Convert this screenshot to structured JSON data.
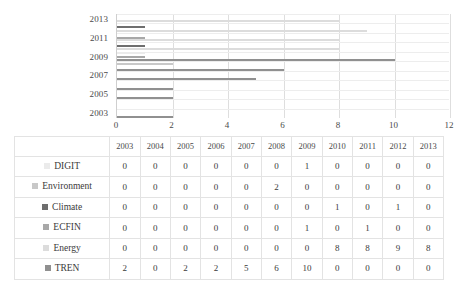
{
  "chart_data": {
    "type": "bar",
    "orientation": "horizontal",
    "title": "",
    "xlabel": "",
    "ylabel": "",
    "xlim": [
      0,
      12
    ],
    "xticks": [
      0,
      2,
      4,
      6,
      8,
      10,
      12
    ],
    "yticks": [
      "2013",
      "2011",
      "2009",
      "2007",
      "2005",
      "2003"
    ],
    "categories": [
      "2003",
      "2004",
      "2005",
      "2006",
      "2007",
      "2008",
      "2009",
      "2010",
      "2011",
      "2012",
      "2013"
    ],
    "grid": true,
    "legend_position": "table",
    "series": [
      {
        "name": "DIGIT",
        "color": "#ebebeb",
        "values": [
          0,
          0,
          0,
          0,
          0,
          0,
          1,
          0,
          0,
          0,
          0
        ]
      },
      {
        "name": "Environment",
        "color": "#c8c8c8",
        "values": [
          0,
          0,
          0,
          0,
          0,
          2,
          0,
          0,
          0,
          0,
          0
        ]
      },
      {
        "name": "Climate",
        "color": "#6e6e6e",
        "values": [
          0,
          0,
          0,
          0,
          0,
          0,
          0,
          1,
          0,
          1,
          0
        ]
      },
      {
        "name": "ECFIN",
        "color": "#a8a8a8",
        "values": [
          0,
          0,
          0,
          0,
          0,
          0,
          1,
          0,
          1,
          0,
          0
        ]
      },
      {
        "name": "Energy",
        "color": "#dcdcdc",
        "values": [
          0,
          0,
          0,
          0,
          0,
          0,
          0,
          8,
          8,
          9,
          8
        ]
      },
      {
        "name": "TREN",
        "color": "#909090",
        "values": [
          2,
          0,
          2,
          2,
          5,
          6,
          10,
          0,
          0,
          0,
          0
        ]
      }
    ]
  },
  "table": {
    "corner_label": "",
    "column_headers": [
      "2003",
      "2004",
      "2005",
      "2006",
      "2007",
      "2008",
      "2009",
      "2010",
      "2011",
      "2012",
      "2013"
    ],
    "rows": [
      {
        "name": "DIGIT",
        "swatch_color": "#ebebeb",
        "values": [
          "0",
          "0",
          "0",
          "0",
          "0",
          "0",
          "1",
          "0",
          "0",
          "0",
          "0"
        ]
      },
      {
        "name": "Environment",
        "swatch_color": "#c8c8c8",
        "values": [
          "0",
          "0",
          "0",
          "0",
          "0",
          "2",
          "0",
          "0",
          "0",
          "0",
          "0"
        ]
      },
      {
        "name": "Climate",
        "swatch_color": "#6e6e6e",
        "values": [
          "0",
          "0",
          "0",
          "0",
          "0",
          "0",
          "0",
          "1",
          "0",
          "1",
          "0"
        ]
      },
      {
        "name": "ECFIN",
        "swatch_color": "#a8a8a8",
        "values": [
          "0",
          "0",
          "0",
          "0",
          "0",
          "0",
          "1",
          "0",
          "1",
          "0",
          "0"
        ]
      },
      {
        "name": "Energy",
        "swatch_color": "#dcdcdc",
        "values": [
          "0",
          "0",
          "0",
          "0",
          "0",
          "0",
          "0",
          "8",
          "8",
          "9",
          "8"
        ]
      },
      {
        "name": "TREN",
        "swatch_color": "#909090",
        "values": [
          "2",
          "0",
          "2",
          "2",
          "5",
          "6",
          "10",
          "0",
          "0",
          "0",
          "0"
        ]
      }
    ]
  }
}
